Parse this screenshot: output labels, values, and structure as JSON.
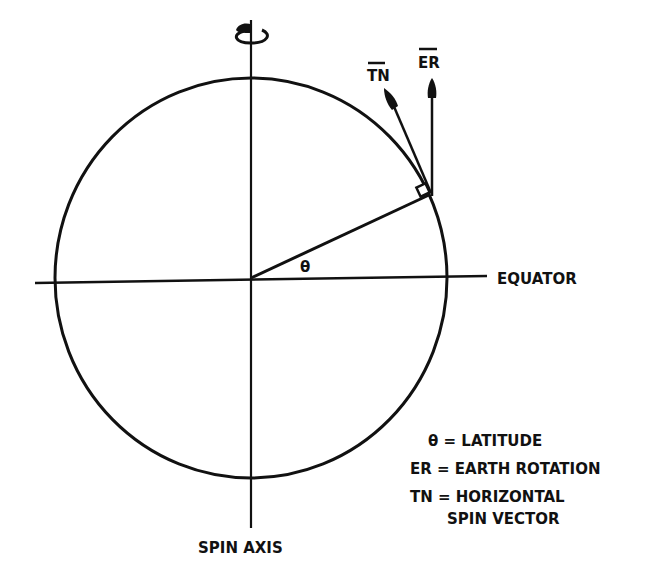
{
  "diagram": {
    "title": "",
    "labels": {
      "spin_axis": "SPIN AXIS",
      "equator": "EQUATOR",
      "theta": "θ",
      "tn_vector": "TN",
      "er_vector": "ER"
    },
    "legend": {
      "lines": [
        "θ = LATITUDE",
        "ER = EARTH ROTATION",
        "TN = HORIZONTAL",
        "SPIN VECTOR"
      ],
      "entries": [
        {
          "symbol": "θ",
          "sep": "=",
          "text": "LATITUDE"
        },
        {
          "symbol": "ER",
          "sep": "=",
          "text": "EARTH ROTATION"
        },
        {
          "symbol": "TN",
          "sep": "=",
          "text": "HORIZONTAL"
        },
        {
          "symbol": "",
          "sep": "",
          "text": "SPIN VECTOR"
        }
      ]
    },
    "icons": {
      "rotation": "rotation-arrow-icon"
    },
    "colors": {
      "ink": "#111111",
      "background": "#ffffff"
    }
  }
}
